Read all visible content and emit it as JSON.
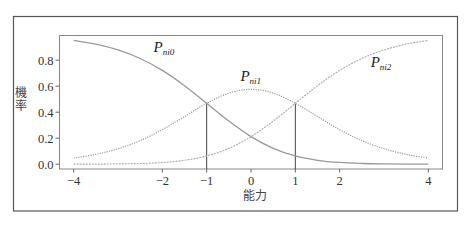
{
  "chart_data": {
    "type": "line",
    "title": "",
    "xlabel": "能力",
    "ylabel": "機率",
    "xlim": [
      -4.32,
      4.32
    ],
    "ylim": [
      -0.037,
      0.99
    ],
    "grid": false,
    "legend": "none (curves labeled inline)",
    "xticks": [
      -4,
      -2,
      -1,
      0,
      1,
      2,
      4
    ],
    "xtick_labels": [
      "−4",
      "−2",
      "−1",
      "0",
      "1",
      "2",
      "4"
    ],
    "yticks": [
      0.0,
      0.2,
      0.4,
      0.6,
      0.8
    ],
    "ytick_labels": [
      "0.0",
      "0.2",
      "0.4",
      "0.6",
      "0.8"
    ],
    "x": [
      -4,
      -3.5,
      -3,
      -2.5,
      -2,
      -1.5,
      -1,
      -0.5,
      0,
      0.5,
      1,
      1.5,
      2,
      2.5,
      3,
      3.5,
      4
    ],
    "series": [
      {
        "name": "P_ni0",
        "label_main": "P",
        "label_sub": "ni0",
        "label_at": [
          -2.2,
          0.86
        ],
        "style": "solid",
        "color": "#9a9a9a",
        "values": [
          0.9523,
          0.9234,
          0.8789,
          0.8131,
          0.7214,
          0.6038,
          0.4683,
          0.3315,
          0.2119,
          0.122,
          0.0634,
          0.0301,
          0.0132,
          0.0055,
          0.0022,
          0.0008,
          0.0003
        ]
      },
      {
        "name": "P_ni1",
        "label_main": "P",
        "label_sub": "ni1",
        "label_at": [
          -0.24,
          0.64
        ],
        "style": "dotted",
        "color": "#9a9a9a",
        "values": [
          0.0474,
          0.0758,
          0.1189,
          0.1814,
          0.2654,
          0.3662,
          0.4683,
          0.5466,
          0.5761,
          0.5466,
          0.4683,
          0.3662,
          0.2654,
          0.1814,
          0.1189,
          0.0758,
          0.0474
        ]
      },
      {
        "name": "P_ni2",
        "label_main": "P",
        "label_sub": "ni2",
        "label_at": [
          2.7,
          0.75
        ],
        "style": "dotted",
        "color": "#b0b0b0",
        "values": [
          0.0003,
          0.0008,
          0.0022,
          0.0055,
          0.0132,
          0.0301,
          0.0634,
          0.122,
          0.2119,
          0.3315,
          0.4683,
          0.6038,
          0.7214,
          0.8131,
          0.8789,
          0.9234,
          0.9523
        ]
      }
    ],
    "reference_lines": [
      {
        "x": -1,
        "y": 0.4683
      },
      {
        "x": 1,
        "y": 0.4683
      }
    ]
  }
}
